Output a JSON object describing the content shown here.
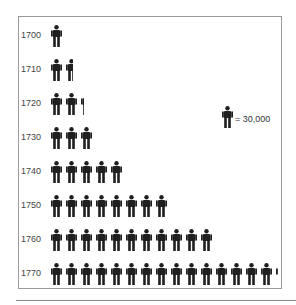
{
  "legend": {
    "icon": "person-icon",
    "label": "= 30,000",
    "unit_value": 30000
  },
  "colors": {
    "icon": "#1f1f1f",
    "frame": "#9a9a9a",
    "text": "#444444"
  },
  "rows": [
    {
      "year": "1700",
      "icons": 1.0
    },
    {
      "year": "1710",
      "icons": 1.6
    },
    {
      "year": "1720",
      "icons": 2.3
    },
    {
      "year": "1730",
      "icons": 3.0
    },
    {
      "year": "1740",
      "icons": 5.0
    },
    {
      "year": "1750",
      "icons": 8.0
    },
    {
      "year": "1760",
      "icons": 11.0
    },
    {
      "year": "1770",
      "icons": 15.2
    }
  ],
  "chart_data": {
    "type": "bar",
    "subtype": "pictograph",
    "title": "",
    "xlabel": "",
    "ylabel": "",
    "categories": [
      "1700",
      "1710",
      "1720",
      "1730",
      "1740",
      "1750",
      "1760",
      "1770"
    ],
    "values": [
      30000,
      48000,
      69000,
      90000,
      150000,
      240000,
      330000,
      456000
    ],
    "icon_counts": [
      1.0,
      1.6,
      2.3,
      3.0,
      5.0,
      8.0,
      11.0,
      15.2
    ],
    "legend": "one person icon = 30,000",
    "orientation": "horizontal",
    "grid": false
  }
}
